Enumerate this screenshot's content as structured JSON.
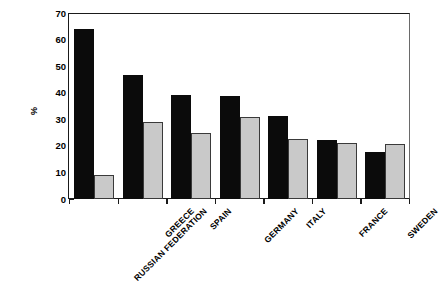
{
  "chart_data": {
    "type": "bar",
    "title": "",
    "subtitle": "",
    "xlabel": "",
    "ylabel": "%",
    "ylim": [
      0,
      70
    ],
    "yticks": [
      0,
      10,
      20,
      30,
      40,
      50,
      60,
      70
    ],
    "grid": false,
    "legend": "none",
    "categories": [
      "RUSSIAN FEDERATION",
      "GREECE",
      "SPAIN",
      "GERMANY",
      "ITALY",
      "FRANCE",
      "SWEDEN"
    ],
    "series": [
      {
        "name": "series-1",
        "color": "#0b0b0b",
        "values": [
          64.0,
          46.8,
          39.3,
          38.9,
          31.3,
          22.2,
          17.6
        ]
      },
      {
        "name": "series-2",
        "color": "#c9c9c9",
        "values": [
          9.2,
          29.1,
          24.7,
          30.7,
          22.5,
          21.2,
          20.6
        ]
      }
    ]
  },
  "axis": {
    "ylabel_text": "%",
    "tick_labels": [
      "70",
      "60",
      "50",
      "40",
      "30",
      "20",
      "10",
      "0"
    ]
  },
  "colors": {
    "series_dark": "#0b0b0b",
    "series_light": "#c9c9c9",
    "axis": "#1a1a1a",
    "background": "#ffffff"
  }
}
